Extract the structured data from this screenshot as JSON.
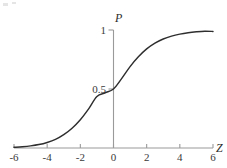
{
  "figure": {
    "background_color": "#ffffff",
    "axis_color": "#9a9a9a",
    "curve_color": "#2e2e2e",
    "tick_label_color": "#3a3a3a",
    "y_axis_name": "P",
    "x_axis_name": "Z"
  },
  "chart_data": {
    "type": "line",
    "title": "",
    "subtitle": "",
    "xlabel": "Z",
    "ylabel": "P",
    "xlim": [
      -6,
      6
    ],
    "ylim": [
      0,
      1.05
    ],
    "grid": false,
    "legend": null,
    "x_ticks": [
      -6,
      -4,
      -2,
      0,
      2,
      4,
      6
    ],
    "x_tick_labels": [
      "-6",
      "-4",
      "-2",
      "0",
      "2",
      "4",
      "6"
    ],
    "y_ticks": [
      0.5,
      1
    ],
    "y_tick_labels": [
      "0.5",
      "1"
    ],
    "annotations": [],
    "series": [
      {
        "name": "cumulative logistic probability",
        "x": [
          -6,
          -5.5,
          -5,
          -4.5,
          -4,
          -3.5,
          -3,
          -2.5,
          -2,
          -1.5,
          -1,
          -0.5,
          0,
          0.5,
          1,
          1.5,
          2,
          2.5,
          3,
          3.5,
          4,
          4.5,
          5,
          5.5,
          6
        ],
        "values": [
          0.006,
          0.011,
          0.018,
          0.029,
          0.047,
          0.073,
          0.113,
          0.168,
          0.24,
          0.332,
          0.437,
          0.468,
          0.5,
          0.59,
          0.69,
          0.773,
          0.84,
          0.889,
          0.924,
          0.948,
          0.965,
          0.977,
          0.985,
          0.99,
          0.988
        ]
      }
    ]
  },
  "x_tick_entries": [
    {
      "value": -6,
      "label": "-6"
    },
    {
      "value": -4,
      "label": "-4"
    },
    {
      "value": -2,
      "label": "-2"
    },
    {
      "value": 0,
      "label": "0"
    },
    {
      "value": 2,
      "label": "2"
    },
    {
      "value": 4,
      "label": "4"
    },
    {
      "value": 6,
      "label": "6"
    }
  ],
  "y_tick_entries": [
    {
      "value": 0.5,
      "label": "0.5"
    },
    {
      "value": 1,
      "label": "1"
    }
  ]
}
